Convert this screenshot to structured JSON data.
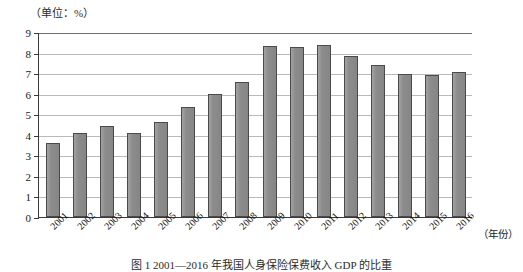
{
  "chart_data": {
    "type": "bar",
    "title": "",
    "unit_label": "（单位：%）",
    "xlabel": "（年份）",
    "ylabel": "",
    "categories": [
      "2001",
      "2002",
      "2003",
      "2004",
      "2005",
      "2006",
      "2007",
      "2008",
      "2009",
      "2010",
      "2011",
      "2012",
      "2013",
      "2014",
      "2015",
      "2016"
    ],
    "values": [
      3.6,
      4.1,
      4.45,
      4.1,
      4.6,
      5.35,
      6.0,
      6.55,
      8.3,
      8.25,
      8.35,
      7.85,
      7.4,
      6.95,
      6.9,
      7.05
    ],
    "ylim": [
      0,
      9
    ],
    "ytick_labels": [
      "0",
      "1",
      "2",
      "3",
      "4",
      "5",
      "6",
      "7",
      "8",
      "9"
    ],
    "yticks": [
      0,
      1,
      2,
      3,
      4,
      5,
      6,
      7,
      8,
      9
    ],
    "grid": true,
    "legend": "none",
    "bar_color": "#8e8e8e",
    "bar_edge_color": "#4a4a4a",
    "grid_color": "#b9b9b9",
    "axis_color": "#3a3a3a"
  },
  "caption": {
    "text": "图 1  2001—2016 年我国人身保险保费收入 GDP 的比重"
  }
}
